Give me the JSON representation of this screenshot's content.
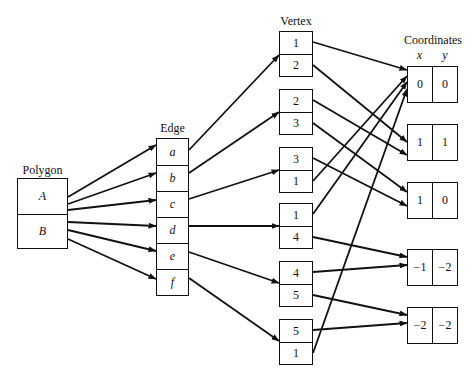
{
  "labels": {
    "polygon": "Polygon",
    "edge": "Edge",
    "vertex": "Vertex",
    "coordinates": "Coordinates",
    "x_header": "x",
    "y_header": "y"
  },
  "polygons": [
    "A",
    "B"
  ],
  "edges": [
    "a",
    "b",
    "c",
    "d",
    "e",
    "f"
  ],
  "vertex_pairs": [
    [
      "1",
      "2"
    ],
    [
      "2",
      "3"
    ],
    [
      "3",
      "1"
    ],
    [
      "1",
      "4"
    ],
    [
      "4",
      "5"
    ],
    [
      "5",
      "1"
    ]
  ],
  "coordinates": [
    {
      "vertex": "1",
      "x": "0",
      "y": "0"
    },
    {
      "vertex": "2",
      "x": "1",
      "y": "1"
    },
    {
      "vertex": "3",
      "x": "1",
      "y": "0"
    },
    {
      "vertex": "4",
      "x": "−1",
      "y": "−2"
    },
    {
      "vertex": "5",
      "x": "−2",
      "y": "−2"
    }
  ],
  "relations": {
    "polygon_to_edges": {
      "A": [
        "a",
        "b",
        "c"
      ],
      "B": [
        "d",
        "e",
        "f"
      ]
    },
    "edge_to_vertex_pair": {
      "a": 0,
      "b": 1,
      "c": 2,
      "d": 3,
      "e": 4,
      "f": 5
    },
    "vertex_to_coordinate": {
      "1": 0,
      "2": 1,
      "3": 2,
      "4": 3,
      "5": 4
    }
  },
  "colors": {
    "stroke": "#111111",
    "background": "#ffffff"
  }
}
